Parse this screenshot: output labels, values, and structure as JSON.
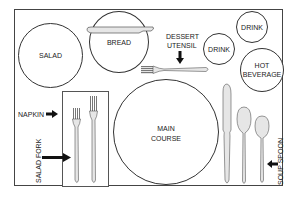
{
  "diagram": {
    "plates": {
      "salad": "SALAD",
      "bread": "BREAD",
      "main_line1": "MAIN",
      "main_line2": "COURSE",
      "drink1": "DRINK",
      "drink2": "DRINK",
      "hot_line1": "HOT",
      "hot_line2": "BEVERAGE"
    },
    "labels": {
      "dessert_line1": "DESSERT",
      "dessert_line2": "UTENSIL",
      "napkin": "NAPKIN",
      "salad_fork": "SALAD FORK",
      "soup_spoon": "SOUP SPOON"
    },
    "colors": {
      "outline": "#333333",
      "utensil_fill": "#e6e6e6",
      "arrow": "#111111"
    }
  }
}
